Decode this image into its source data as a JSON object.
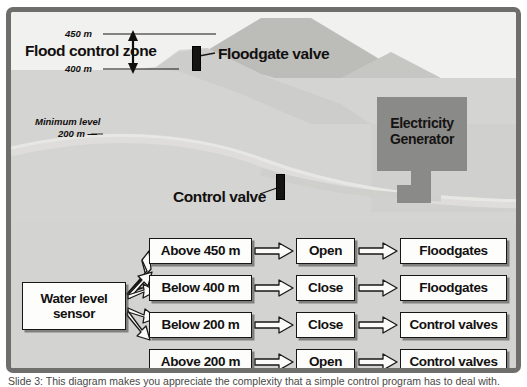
{
  "figure": {
    "caption": "Slide 3: This diagram makes you appreciate the complexity that a simple control program has to deal with."
  },
  "scene": {
    "flood_zone_label": "Flood control zone",
    "level_upper": "450 m",
    "level_lower": "400 m",
    "minimum_level_label": "Minimum level",
    "minimum_level_value": "200 m —",
    "floodgate_valve_label": "Floodgate valve",
    "control_valve_label": "Control valve",
    "generator_line1": "Electricity",
    "generator_line2": "Generator"
  },
  "flowchart": {
    "sensor_line1": "Water level",
    "sensor_line2": "sensor",
    "rows": [
      {
        "condition": "Above 450 m",
        "action": "Open",
        "target": "Floodgates"
      },
      {
        "condition": "Below 400 m",
        "action": "Close",
        "target": "Floodgates"
      },
      {
        "condition": "Below 200 m",
        "action": "Close",
        "target": "Control valves"
      },
      {
        "condition": "Above 200 m",
        "action": "Open",
        "target": "Control valves"
      }
    ]
  },
  "colors": {
    "frame_border": "#6e6e6c",
    "sky_band": "#f1f1ef",
    "terrain_light": "#d4d4d2",
    "terrain_mid": "#c6c6c3",
    "mountain_dark": "#bcbcb9",
    "generator_box": "#8a8a88",
    "valve_black": "#161413",
    "box_fill": "#fdfdfc",
    "ink": "#121110"
  }
}
